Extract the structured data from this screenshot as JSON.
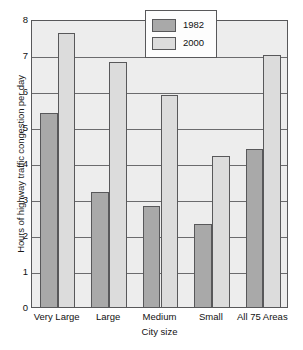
{
  "chart_data": {
    "type": "bar",
    "title": "",
    "xlabel": "City size",
    "ylabel": "Hours of highway traffic congestion per day",
    "categories": [
      "Very Large",
      "Large",
      "Medium",
      "Small",
      "All 75 Areas"
    ],
    "series": [
      {
        "name": "1982",
        "color": "#a9a9a9",
        "values": [
          5.4,
          3.2,
          2.8,
          2.3,
          4.4
        ]
      },
      {
        "name": "2000",
        "color": "#dcdcdc",
        "values": [
          7.6,
          6.8,
          5.9,
          4.2,
          7.0
        ]
      }
    ],
    "ylim": [
      0,
      8
    ],
    "yticks": [
      0,
      1,
      2,
      3,
      4,
      5,
      6,
      7,
      8
    ],
    "ytick_labels": [
      "0",
      "1",
      "2",
      "3",
      "4",
      "5",
      "6",
      "7",
      "8"
    ],
    "grid": true,
    "legend_position": "top-right",
    "legend_entries": [
      "1982",
      "2000"
    ]
  }
}
